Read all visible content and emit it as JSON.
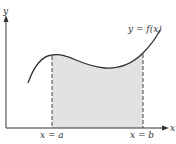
{
  "diagram": {
    "curve_label": "y = f(x)",
    "x_axis_label": "x",
    "y_axis_label": "y",
    "left_bound_label": "x = a",
    "right_bound_label": "x = b",
    "colors": {
      "axis": "#333333",
      "curve": "#333333",
      "fill": "#e2e2e2",
      "dashed": "#444444"
    }
  }
}
